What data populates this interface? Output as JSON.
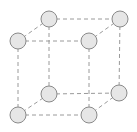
{
  "diagram": {
    "type": "simple-cubic-unit-cell",
    "colors": {
      "background": "#ffffff",
      "atom_fill": "#e6e6e6",
      "atom_stroke": "#8a8a8a",
      "edge_stroke": "#9a9a9a"
    },
    "atom_radius": 8,
    "atoms": [
      {
        "id": "back-top-left",
        "x": 49,
        "y": 19
      },
      {
        "id": "back-top-right",
        "x": 120,
        "y": 19
      },
      {
        "id": "front-top-left",
        "x": 18,
        "y": 41
      },
      {
        "id": "front-top-right",
        "x": 89,
        "y": 41
      },
      {
        "id": "back-bottom-left",
        "x": 49,
        "y": 94
      },
      {
        "id": "back-bottom-right",
        "x": 119,
        "y": 93
      },
      {
        "id": "front-bottom-left",
        "x": 18,
        "y": 115
      },
      {
        "id": "front-bottom-right",
        "x": 89,
        "y": 115
      }
    ],
    "edges": [
      [
        "back-top-left",
        "back-top-right"
      ],
      [
        "front-top-left",
        "front-top-right"
      ],
      [
        "back-bottom-left",
        "back-bottom-right"
      ],
      [
        "front-bottom-left",
        "front-bottom-right"
      ],
      [
        "back-top-left",
        "back-bottom-left"
      ],
      [
        "back-top-right",
        "back-bottom-right"
      ],
      [
        "front-top-left",
        "front-bottom-left"
      ],
      [
        "front-top-right",
        "front-bottom-right"
      ],
      [
        "back-top-left",
        "front-top-left"
      ],
      [
        "back-top-right",
        "front-top-right"
      ],
      [
        "back-bottom-left",
        "front-bottom-left"
      ],
      [
        "back-bottom-right",
        "front-bottom-right"
      ]
    ]
  }
}
